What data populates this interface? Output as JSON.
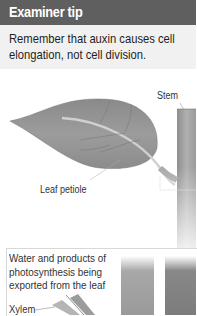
{
  "examiner_tip": {
    "title": "Examiner tip",
    "body": "Remember that auxin causes cell elongation, not cell division."
  },
  "leaf_diagram": {
    "labels": {
      "stem": "Stem",
      "leaf_petiole": "Leaf petiole"
    }
  },
  "transport_panel": {
    "caption": "Water and products of photosynthesis being exported from the leaf",
    "labels": {
      "xylem": "Xylem"
    }
  }
}
